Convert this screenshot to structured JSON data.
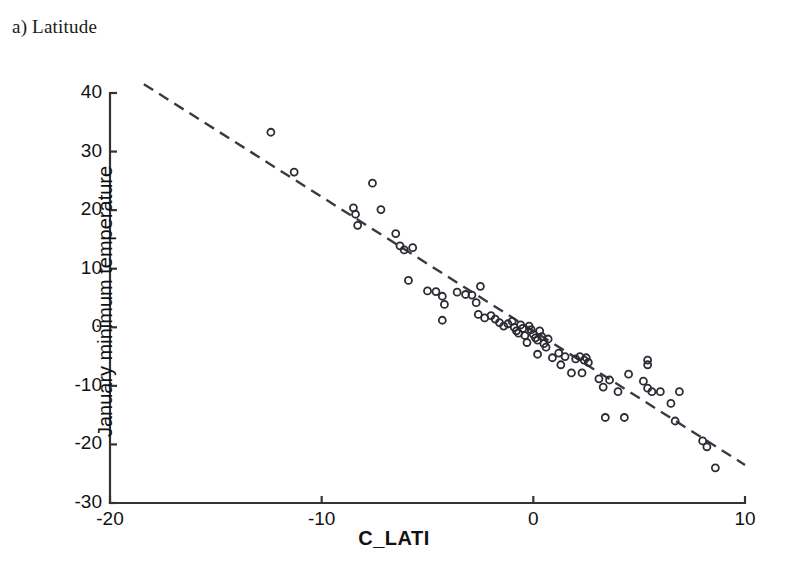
{
  "panel": {
    "label": "a) Latitude"
  },
  "chart_data": {
    "type": "scatter",
    "title": "a) Latitude",
    "xlabel": "C_LATI",
    "ylabel": "January minimum temperature",
    "xlim": [
      -20,
      10
    ],
    "ylim": [
      -30,
      40
    ],
    "xticks": [
      -20,
      -10,
      0,
      10
    ],
    "xtick_labels": [
      "-20",
      "-10",
      "0",
      "10"
    ],
    "yticks": [
      40,
      30,
      20,
      10,
      0,
      -10,
      -20,
      -30
    ],
    "ytick_labels": [
      "40",
      "30",
      "20",
      "10",
      "0",
      "-10",
      "-20",
      "-30"
    ],
    "grid": false,
    "legend": null,
    "marker": "open-circle",
    "marker_size": 7,
    "trendline": {
      "style": "dashed",
      "x_start": -18.4,
      "y_start": 41.5,
      "x_end": 10.0,
      "y_end": -23.5,
      "slope": -2.288,
      "intercept": -0.62
    },
    "points": [
      [
        -12.4,
        33.3
      ],
      [
        -11.3,
        26.5
      ],
      [
        -8.5,
        20.4
      ],
      [
        -8.4,
        19.3
      ],
      [
        -8.3,
        17.4
      ],
      [
        -7.6,
        24.6
      ],
      [
        -7.2,
        20.1
      ],
      [
        -6.5,
        16.0
      ],
      [
        -6.3,
        13.9
      ],
      [
        -6.1,
        13.2
      ],
      [
        -5.7,
        13.6
      ],
      [
        -5.9,
        8.0
      ],
      [
        -5.0,
        6.2
      ],
      [
        -4.6,
        6.1
      ],
      [
        -4.3,
        5.3
      ],
      [
        -4.2,
        3.9
      ],
      [
        -4.3,
        1.2
      ],
      [
        -3.6,
        6.0
      ],
      [
        -3.2,
        5.6
      ],
      [
        -2.9,
        5.5
      ],
      [
        -2.7,
        4.2
      ],
      [
        -2.5,
        7.0
      ],
      [
        -2.6,
        2.2
      ],
      [
        -2.3,
        1.6
      ],
      [
        -2.0,
        2.0
      ],
      [
        -1.8,
        1.4
      ],
      [
        -1.6,
        0.8
      ],
      [
        -1.4,
        0.2
      ],
      [
        -1.2,
        0.6
      ],
      [
        -1.0,
        1.0
      ],
      [
        -0.9,
        0.0
      ],
      [
        -0.8,
        -0.6
      ],
      [
        -0.7,
        -1.0
      ],
      [
        -0.6,
        0.4
      ],
      [
        -0.5,
        -0.2
      ],
      [
        -0.4,
        -1.4
      ],
      [
        -0.3,
        -2.6
      ],
      [
        -0.2,
        0.2
      ],
      [
        -0.1,
        -0.4
      ],
      [
        0.0,
        -1.2
      ],
      [
        0.1,
        -1.8
      ],
      [
        0.2,
        -2.2
      ],
      [
        0.3,
        -0.6
      ],
      [
        0.4,
        -1.6
      ],
      [
        0.5,
        -2.8
      ],
      [
        0.6,
        -3.4
      ],
      [
        0.7,
        -2.0
      ],
      [
        0.2,
        -4.6
      ],
      [
        0.9,
        -5.2
      ],
      [
        1.2,
        -4.4
      ],
      [
        1.3,
        -6.4
      ],
      [
        1.5,
        -5.0
      ],
      [
        2.0,
        -5.4
      ],
      [
        2.2,
        -5.0
      ],
      [
        2.4,
        -5.6
      ],
      [
        2.5,
        -5.2
      ],
      [
        2.6,
        -6.0
      ],
      [
        1.8,
        -7.8
      ],
      [
        2.3,
        -7.8
      ],
      [
        3.1,
        -8.8
      ],
      [
        3.3,
        -10.2
      ],
      [
        3.6,
        -9.0
      ],
      [
        4.0,
        -11.0
      ],
      [
        3.4,
        -15.4
      ],
      [
        4.3,
        -15.4
      ],
      [
        5.2,
        -9.2
      ],
      [
        5.4,
        -10.4
      ],
      [
        5.6,
        -11.0
      ],
      [
        6.0,
        -11.0
      ],
      [
        5.4,
        -5.6
      ],
      [
        5.4,
        -6.4
      ],
      [
        4.5,
        -8.0
      ],
      [
        6.5,
        -13.0
      ],
      [
        6.9,
        -11.0
      ],
      [
        6.7,
        -16.0
      ],
      [
        8.0,
        -19.4
      ],
      [
        8.2,
        -20.4
      ],
      [
        8.6,
        -24.0
      ]
    ]
  }
}
